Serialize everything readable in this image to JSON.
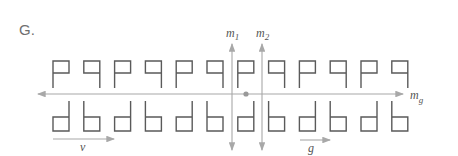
{
  "figure": {
    "label": "G.",
    "mirror_lines": [
      {
        "name": "m",
        "subscript": "1"
      },
      {
        "name": "m",
        "subscript": "2"
      }
    ],
    "glide_axis": {
      "name": "m",
      "subscript": "g"
    },
    "translation_vector": {
      "label": "v"
    },
    "glide_vector": {
      "label": "g"
    },
    "top_row": [
      "P",
      "q",
      "P",
      "q",
      "P",
      "q",
      "P",
      "q",
      "P",
      "q",
      "P",
      "q"
    ],
    "bottom_row": [
      "d",
      "b",
      "d",
      "b",
      "d",
      "b",
      "d",
      "b",
      "d",
      "b",
      "d",
      "b"
    ],
    "colors": {
      "glyph": "#5a5a5a",
      "axis": "#a8a8a8",
      "center_dot": "#999999"
    }
  }
}
